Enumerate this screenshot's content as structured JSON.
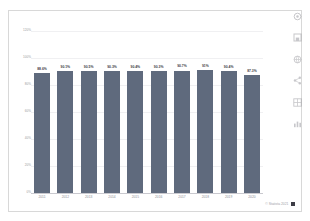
{
  "chart_data": {
    "type": "bar",
    "title": "",
    "subtitle": "",
    "xlabel": "",
    "ylabel": "",
    "categories": [
      "2011",
      "2012",
      "2013",
      "2014",
      "2015",
      "2016",
      "2017",
      "2018",
      "2019",
      "2020"
    ],
    "values": [
      88.6,
      90.1,
      90.5,
      90.3,
      90.4,
      90.3,
      90.7,
      91.0,
      90.4,
      87.3
    ],
    "value_labels": [
      "88.6%",
      "90.1%",
      "90.5%",
      "90.3%",
      "90.4%",
      "90.3%",
      "90.7%",
      "91%",
      "90.4%",
      "87.3%"
    ],
    "ylim": [
      0,
      120
    ],
    "ytick_values": [
      0,
      20,
      40,
      60,
      80,
      100,
      120
    ],
    "ytick_labels": [
      "0%",
      "20%",
      "40%",
      "60%",
      "80%",
      "100%",
      "120%"
    ],
    "grid": true,
    "legend": "none",
    "series_color": "#5f6a7d"
  },
  "footer": {
    "copyright": "© Statista 2021",
    "mark_icon": "statista-square-icon"
  },
  "toolbar": {
    "icons": [
      "settings-gear-icon",
      "save-disk-icon",
      "globe-icon",
      "share-nodes-icon",
      "table-grid-icon",
      "bar-chart-icon"
    ]
  },
  "colors": {
    "bar": "#5f6a7d",
    "grid": "#f0f0f2",
    "axis": "#c9c9cf",
    "tick_text": "#9a9aa2",
    "value_text": "#3d3d46",
    "card_border": "#d8d8d8",
    "background": "#ffffff"
  }
}
